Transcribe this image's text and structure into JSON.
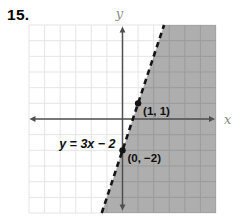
{
  "problem": {
    "number_label": "15."
  },
  "chart_data": {
    "type": "line",
    "title": "",
    "equation_label": "y = 3x − 2",
    "axes": {
      "x_label": "x",
      "y_label": "y",
      "xlim": [
        -6,
        6
      ],
      "ylim": [
        -6,
        6
      ],
      "grid": true,
      "grid_step": 1,
      "tick_labels_shown": false
    },
    "boundary_line": {
      "style": "dashed",
      "slope": 3,
      "y_intercept": -2,
      "through_points": [
        [
          0,
          -2
        ],
        [
          1,
          1
        ]
      ]
    },
    "marked_points": [
      {
        "x": 1,
        "y": 1,
        "label": "(1, 1)"
      },
      {
        "x": 0,
        "y": -2,
        "label": "(0, −2)"
      }
    ],
    "shaded_region": {
      "side": "right-of-line",
      "fill_color": "#aeaeae",
      "grid_line_color": "#9b9b9b"
    },
    "colors": {
      "grid_light": "#e5e5e5",
      "axis": "#4f4f4f",
      "axis_label": "#8c8c8c",
      "line": "#141414",
      "point": "#141414",
      "text": "#101010"
    }
  }
}
